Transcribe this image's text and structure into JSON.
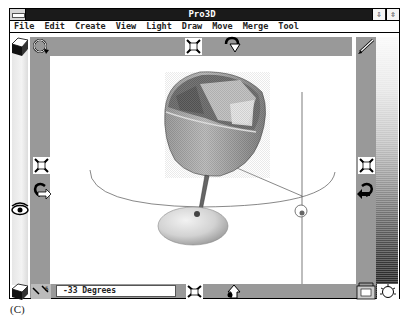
{
  "window": {
    "title": "Pro3D",
    "minimize_icon": "down-arrow-icon",
    "maximize_icon": "resize-arrows-icon"
  },
  "menubar": {
    "items": [
      "File",
      "Edit",
      "Create",
      "View",
      "Light",
      "Draw",
      "Move",
      "Merge",
      "Tool"
    ]
  },
  "toolbar_icons": {
    "top_left": [
      "cube-icon",
      "rotate-icon"
    ],
    "top_center": [
      "scale-arrows-icon",
      "rotate-down-icon"
    ],
    "top_right": "pencil-icon",
    "left": [
      "scale-arrows-icon",
      "rotate-right-icon",
      "eye-icon"
    ],
    "right": [
      "scale-arrows-icon",
      "rotate-left-icon"
    ],
    "bottom_left": [
      "cube-icon",
      "zoom-icon"
    ],
    "bottom_center": [
      "scale-arrows-icon",
      "rotate-up-icon"
    ],
    "bottom_right": [
      "render-icon",
      "light-bulb-icon"
    ]
  },
  "status": {
    "value": "-33 Degrees"
  },
  "viewport": {
    "object": "goblet",
    "background": "#ffffff",
    "frame_color": "#999999"
  },
  "palette": {
    "type": "grayscale-gradient"
  },
  "caption": "(C)"
}
